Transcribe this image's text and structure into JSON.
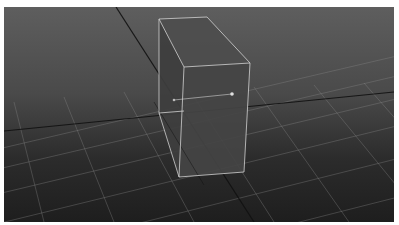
{
  "viewport": {
    "name": "3D perspective viewport",
    "background_top": "#5e5e5e",
    "background_bottom": "#1e1e1e",
    "grid_color": "#8a8a8a",
    "axis_color": "#111111",
    "selection_color": "#d8d8d8"
  },
  "scene": {
    "selected_object": "box",
    "grid_lines_x": [
      [
        [
          -40,
          150
        ],
        [
          560,
          10
        ]
      ],
      [
        [
          -40,
          170
        ],
        [
          560,
          30
        ]
      ],
      [
        [
          -40,
          195
        ],
        [
          560,
          52
        ]
      ],
      [
        [
          -40,
          225
        ],
        [
          560,
          78
        ]
      ],
      [
        [
          -40,
          260
        ],
        [
          560,
          110
        ]
      ],
      [
        [
          -40,
          300
        ],
        [
          560,
          148
        ]
      ]
    ],
    "grid_lines_z": [
      [
        [
          10,
          95
        ],
        [
          40,
          215
        ]
      ],
      [
        [
          60,
          90
        ],
        [
          110,
          215
        ]
      ],
      [
        [
          120,
          85
        ],
        [
          190,
          215
        ]
      ],
      [
        [
          185,
          82
        ],
        [
          270,
          215
        ]
      ],
      [
        [
          250,
          80
        ],
        [
          345,
          215
        ]
      ],
      [
        [
          310,
          78
        ],
        [
          410,
          200
        ]
      ],
      [
        [
          360,
          76
        ],
        [
          460,
          190
        ]
      ]
    ],
    "axis_lines": [
      [
        [
          112,
          0
        ],
        [
          250,
          215
        ]
      ],
      [
        [
          0,
          124
        ],
        [
          390,
          85
        ]
      ]
    ],
    "box_faces": [
      [
        [
          155,
          12
        ],
        [
          203,
          10
        ],
        [
          246,
          56
        ],
        [
          180,
          60
        ]
      ],
      [
        [
          155,
          12
        ],
        [
          180,
          60
        ],
        [
          175,
          170
        ],
        [
          155,
          106
        ]
      ],
      [
        [
          180,
          60
        ],
        [
          246,
          56
        ],
        [
          240,
          165
        ],
        [
          175,
          170
        ]
      ]
    ],
    "box_edges": [
      [
        [
          155,
          12
        ],
        [
          203,
          10
        ]
      ],
      [
        [
          203,
          10
        ],
        [
          246,
          56
        ]
      ],
      [
        [
          246,
          56
        ],
        [
          180,
          60
        ]
      ],
      [
        [
          180,
          60
        ],
        [
          155,
          12
        ]
      ],
      [
        [
          155,
          12
        ],
        [
          155,
          106
        ]
      ],
      [
        [
          155,
          106
        ],
        [
          175,
          170
        ]
      ],
      [
        [
          175,
          170
        ],
        [
          240,
          165
        ]
      ],
      [
        [
          240,
          165
        ],
        [
          246,
          56
        ]
      ],
      [
        [
          180,
          60
        ],
        [
          175,
          170
        ]
      ],
      [
        [
          155,
          106
        ],
        [
          180,
          104
        ]
      ]
    ],
    "pivot": [
      [
        170,
        93
      ],
      [
        228,
        87
      ]
    ]
  }
}
